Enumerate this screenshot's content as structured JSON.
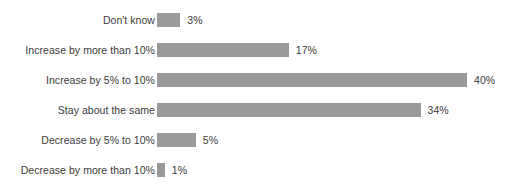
{
  "chart_data": {
    "type": "bar",
    "orientation": "horizontal",
    "title": "",
    "subtitle": "",
    "xlabel": "",
    "ylabel": "",
    "grid": false,
    "legend": null,
    "axis_visible": false,
    "xlim": [
      0,
      40
    ],
    "value_suffix": "%",
    "bar_color": "#9a9a9a",
    "label_color": "#3b3b3b",
    "background": "#ffffff",
    "categories": [
      "Don't know",
      "Increase by more than 10%",
      "Increase by 5% to 10%",
      "Stay about the same",
      "Decrease by 5% to 10%",
      "Decrease by more than 10%"
    ],
    "values": [
      3,
      17,
      40,
      34,
      5,
      1
    ],
    "value_labels": [
      "3%",
      "17%",
      "40%",
      "34%",
      "5%",
      "1%"
    ],
    "rows": [
      {
        "label": "Don't know",
        "value": 3,
        "value_label": "3%"
      },
      {
        "label": "Increase by more than 10%",
        "value": 17,
        "value_label": "17%"
      },
      {
        "label": "Increase by 5% to 10%",
        "value": 40,
        "value_label": "40%"
      },
      {
        "label": "Stay about the same",
        "value": 34,
        "value_label": "34%"
      },
      {
        "label": "Decrease by 5% to 10%",
        "value": 5,
        "value_label": "5%"
      },
      {
        "label": "Decrease by more than 10%",
        "value": 1,
        "value_label": "1%"
      }
    ]
  }
}
